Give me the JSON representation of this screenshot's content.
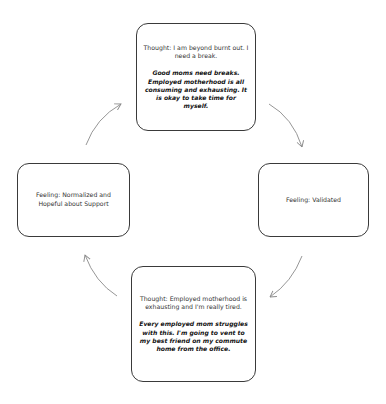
{
  "diagram": {
    "type": "cycle",
    "direction": "clockwise",
    "nodes": [
      {
        "id": "top",
        "thought": "Thought: I am beyond burnt out. I need a break.",
        "reframe": "Good moms need breaks. Employed motherhood is all consuming and exhausting. It is okay to take time for myself."
      },
      {
        "id": "right",
        "feeling": "Feeling: Validated"
      },
      {
        "id": "bottom",
        "thought": "Thought: Employed motherhood is exhausting and I'm really tired.",
        "reframe": "Every employed mom struggles with this. I'm going to vent to my best friend on my commute home from the office."
      },
      {
        "id": "left",
        "feeling": "Feeling: Normalized and Hopeful about Support"
      }
    ],
    "edges": [
      {
        "from": "top",
        "to": "right"
      },
      {
        "from": "right",
        "to": "bottom"
      },
      {
        "from": "bottom",
        "to": "left"
      },
      {
        "from": "left",
        "to": "top"
      }
    ],
    "colors": {
      "border": "#3a3a3a",
      "arrow": "#8a8a8a",
      "background": "#ffffff"
    }
  }
}
